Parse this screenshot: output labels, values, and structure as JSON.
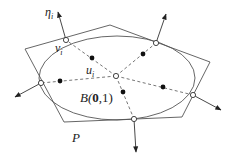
{
  "diagram": {
    "labels": {
      "eta": "η",
      "eta_sub": "i",
      "v": "v",
      "v_sub": "i",
      "u": "u",
      "u_sub": "i",
      "ball_prefix": "B(",
      "ball_zero": "0",
      "ball_suffix": ",1)",
      "polygon": "P"
    },
    "colors": {
      "stroke": "#555555",
      "dot": "#111111"
    }
  }
}
